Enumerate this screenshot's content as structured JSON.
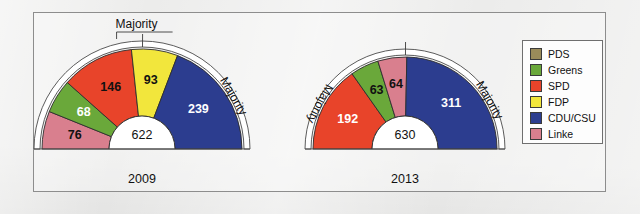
{
  "figure": {
    "background_color": "#ececeb",
    "frame_color": "#8d8d8d",
    "majority_label": "Majority"
  },
  "legend": {
    "items": [
      {
        "label": "PDS",
        "color": "#9a8b5a"
      },
      {
        "label": "Greens",
        "color": "#6aa83a"
      },
      {
        "label": "SPD",
        "color": "#e8442a"
      },
      {
        "label": "FDP",
        "color": "#f2e63c"
      },
      {
        "label": "CDU/CSU",
        "color": "#2c3d8f"
      },
      {
        "label": "Linke",
        "color": "#d97f8e"
      }
    ]
  },
  "chart_data": [
    {
      "type": "pie",
      "title": "2009",
      "subtype": "half-donut-seat-diagram",
      "total": 622,
      "total_label": "622",
      "center": {
        "x": 142,
        "y": 149
      },
      "inner_radius": 33,
      "outer_radius": 100,
      "band_outer_radius": 108,
      "majority_seats": 312,
      "majority_label": "Majority",
      "categories": [
        "Linke",
        "Greens",
        "SPD",
        "FDP",
        "CDU/CSU"
      ],
      "values": [
        76,
        68,
        146,
        93,
        239
      ],
      "colors": [
        "#d97f8e",
        "#6aa83a",
        "#e8442a",
        "#f2e63c",
        "#2c3d8f"
      ],
      "label_colors": [
        "#111111",
        "#ffffff",
        "#111111",
        "#111111",
        "#ffffff"
      ],
      "labels": [
        "76",
        "68",
        "146",
        "93",
        "239"
      ],
      "legend_position": "right"
    },
    {
      "type": "pie",
      "title": "2013",
      "subtype": "half-donut-seat-diagram",
      "total": 630,
      "total_label": "630",
      "center": {
        "x": 405,
        "y": 149
      },
      "inner_radius": 33,
      "outer_radius": 92,
      "band_outer_radius": 100,
      "majority_seats": 316,
      "majority_label": "Majority",
      "categories": [
        "SPD",
        "Greens",
        "Linke",
        "CDU/CSU"
      ],
      "values": [
        192,
        63,
        64,
        311
      ],
      "colors": [
        "#e8442a",
        "#6aa83a",
        "#d97f8e",
        "#2c3d8f"
      ],
      "label_colors": [
        "#ffffff",
        "#111111",
        "#111111",
        "#ffffff"
      ],
      "labels": [
        "192",
        "63",
        "64",
        "311"
      ],
      "legend_position": "right"
    }
  ]
}
